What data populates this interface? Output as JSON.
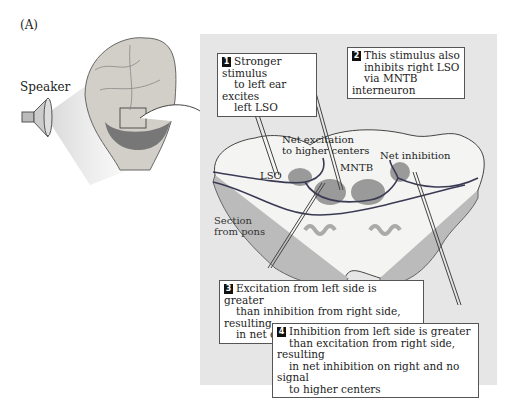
{
  "figure": {
    "panel_label": "(A)",
    "speaker_label": "Speaker",
    "labels": {
      "net_excitation": "Net excitation",
      "net_excitation_2": "to higher centers",
      "net_inhibition": "Net inhibition",
      "lso": "LSO",
      "mntb": "MNTB",
      "section": "Section",
      "section_2": "from pons"
    },
    "callouts": [
      {
        "number": "1",
        "lines": [
          "Stronger stimulus",
          "to left ear excites",
          "left LSO"
        ]
      },
      {
        "number": "2",
        "lines": [
          "This stimulus also",
          "inhibits right LSO",
          "via MNTB interneuron"
        ]
      },
      {
        "number": "3",
        "lines": [
          "Excitation from left side is greater",
          "than inhibition from right side, resulting",
          "in net excitation to higher centers"
        ]
      },
      {
        "number": "4",
        "lines": [
          "Inhibition from left side is greater",
          "than excitation from right side, resulting",
          "in net inhibition on right and no signal",
          "to higher centers"
        ]
      }
    ],
    "colors": {
      "panel": "#e6e6e6",
      "pons": "#f4f4f2",
      "nuclei": "#9a9a9a",
      "fiber": "#3a3a55"
    }
  }
}
